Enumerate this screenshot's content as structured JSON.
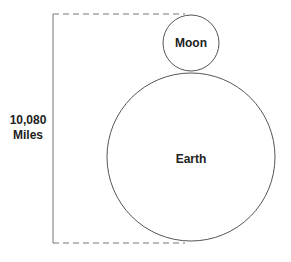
{
  "diagram": {
    "measure_value": "10,080",
    "measure_unit": "Miles",
    "bodies": [
      {
        "label": "Moon"
      },
      {
        "label": "Earth"
      }
    ],
    "colors": {
      "stroke": "#555555",
      "text": "#222222",
      "background": "#ffffff"
    }
  }
}
